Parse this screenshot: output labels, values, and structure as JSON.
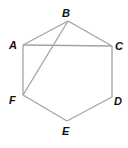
{
  "diagram": {
    "type": "geometry",
    "shape": "hexagon ABCDEF with diagonals AC and BF",
    "stroke_color": "#a3a3a3",
    "label_color": "#111111",
    "vertices": [
      {
        "name": "A",
        "x": 23,
        "y": 45,
        "label_x": 9,
        "label_y": 49
      },
      {
        "name": "B",
        "x": 68,
        "y": 21,
        "label_x": 62,
        "label_y": 17
      },
      {
        "name": "C",
        "x": 112,
        "y": 46,
        "label_x": 115,
        "label_y": 50
      },
      {
        "name": "D",
        "x": 112,
        "y": 97,
        "label_x": 114,
        "label_y": 105
      },
      {
        "name": "E",
        "x": 67,
        "y": 121,
        "label_x": 62,
        "label_y": 135
      },
      {
        "name": "F",
        "x": 23,
        "y": 95,
        "label_x": 9,
        "label_y": 104
      }
    ],
    "segments": [
      {
        "from": "A",
        "to": "B"
      },
      {
        "from": "B",
        "to": "C"
      },
      {
        "from": "C",
        "to": "D"
      },
      {
        "from": "D",
        "to": "E"
      },
      {
        "from": "E",
        "to": "F"
      },
      {
        "from": "F",
        "to": "A"
      },
      {
        "from": "A",
        "to": "C"
      },
      {
        "from": "B",
        "to": "F"
      }
    ]
  }
}
